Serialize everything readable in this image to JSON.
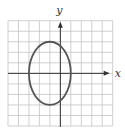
{
  "chart_data": {
    "type": "line",
    "title": "",
    "xlabel": "x",
    "ylabel": "y",
    "xlim": [
      -5,
      5
    ],
    "ylim": [
      -5,
      5
    ],
    "grid": true,
    "grid_step": 1,
    "tick_labels_shown": false,
    "series": [
      {
        "name": "ellipse",
        "shape": "ellipse",
        "center": [
          -1,
          0
        ],
        "semi_axis_x": 2,
        "semi_axis_y": 3,
        "equation": "(x+1)^2/4 + y^2/9 = 1"
      }
    ],
    "colors": {
      "grid": "#c4c4c4",
      "axes": "#333333",
      "curve": "#555555"
    }
  }
}
